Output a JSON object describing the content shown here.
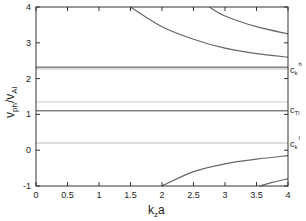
{
  "chart_data": {
    "type": "line",
    "title": "",
    "xlabel": "k_z a",
    "ylabel": "v_ph/v_Al",
    "xlim": [
      0,
      4
    ],
    "ylim": [
      -1,
      4
    ],
    "xticks": [
      "0",
      "0.5",
      "1",
      "1.5",
      "2",
      "2.5",
      "3",
      "3.5",
      "4"
    ],
    "yticks": [
      "-1",
      "0",
      "1",
      "2",
      "3",
      "4"
    ],
    "grid": false,
    "legend": null,
    "horizontal_lines": [
      {
        "name": "c_k^h",
        "y": 2.32,
        "color": "#444444",
        "label": "c_k^h"
      },
      {
        "name": "c_k^h-gray",
        "y": 2.27,
        "color": "#bbbbbb",
        "label": ""
      },
      {
        "name": "gray-mid",
        "y": 1.35,
        "color": "#cccccc",
        "label": ""
      },
      {
        "name": "c_T",
        "y": 1.1,
        "color": "#444444",
        "label": "c_Tl"
      },
      {
        "name": "c_k^l",
        "y": 0.2,
        "color": "#bbbbbb",
        "label": "c_k^l"
      }
    ],
    "series": [
      {
        "name": "upper-branch-1",
        "x": [
          1.5,
          2.0,
          2.5,
          3.0,
          3.5,
          4.0
        ],
        "y": [
          4.0,
          3.45,
          3.1,
          2.85,
          2.7,
          2.6
        ]
      },
      {
        "name": "upper-branch-2",
        "x": [
          2.75,
          3.0,
          3.5,
          4.0
        ],
        "y": [
          4.0,
          3.75,
          3.45,
          3.25
        ]
      },
      {
        "name": "lower-branch-1",
        "x": [
          2.0,
          2.5,
          3.0,
          3.5,
          4.0
        ],
        "y": [
          -1.0,
          -0.6,
          -0.38,
          -0.25,
          -0.15
        ]
      },
      {
        "name": "lower-branch-2",
        "x": [
          3.55,
          3.75,
          4.0
        ],
        "y": [
          -1.0,
          -0.9,
          -0.8
        ]
      }
    ],
    "annotations": [
      {
        "text": "c_k^h",
        "y": 2.32
      },
      {
        "text": "c_Tl",
        "y": 1.1
      },
      {
        "text": "c_k^l",
        "y": 0.2
      }
    ]
  },
  "labels": {
    "xlabel_main": "k",
    "xlabel_sub": "z",
    "xlabel_tail": "a",
    "ylabel_main": "v",
    "ylabel_sub1": "ph",
    "ylabel_mid": "/v",
    "ylabel_sub2": "Al",
    "ckh_main": "c",
    "ckh_sub": "k",
    "ckh_sup": "h",
    "ct_main": "c",
    "ct_sub": "Tl",
    "ckl_main": "c",
    "ckl_sub": "k",
    "ckl_sup": "l"
  }
}
